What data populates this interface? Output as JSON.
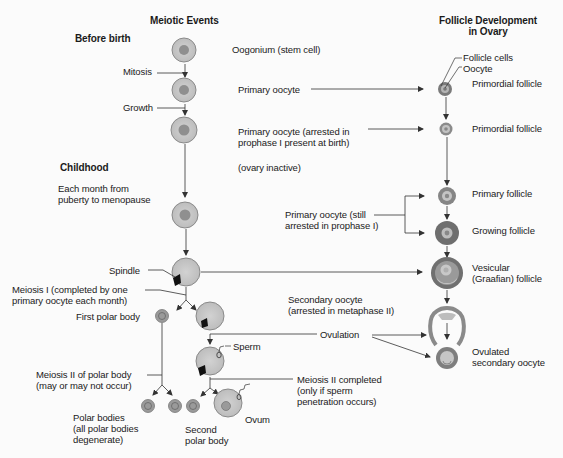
{
  "headers": {
    "meiotic_events": "Meiotic Events",
    "follicle_development_line1": "Follicle Development",
    "follicle_development_line2": "in Ovary"
  },
  "stages": {
    "before_birth": "Before birth",
    "childhood": "Childhood",
    "each_month_line1": "Each month from",
    "each_month_line2": "puberty to menopause"
  },
  "processes": {
    "mitosis": "Mitosis",
    "growth": "Growth",
    "spindle": "Spindle",
    "meiosis1_line1": "Meiosis I (completed by one",
    "meiosis1_line2": "primary oocyte each month)",
    "meiosis2_polar_line1": "Meiosis II of polar body",
    "meiosis2_polar_line2": "(may or may not occur)",
    "ovulation": "Ovulation",
    "sperm": "Sperm",
    "meiosis2_completed_line1": "Meiosis II completed",
    "meiosis2_completed_line2": "(only if sperm",
    "meiosis2_completed_line3": "penetration occurs)"
  },
  "cells": {
    "oogonium": "Oogonium (stem cell)",
    "primary_oocyte": "Primary oocyte",
    "primary_oocyte_arrested_line1": "Primary oocyte (arrested in",
    "primary_oocyte_arrested_line2": "prophase I present at birth)",
    "ovary_inactive": "(ovary inactive)",
    "primary_oocyte_still_line1": "Primary oocyte (still",
    "primary_oocyte_still_line2": "arrested in prophase I)",
    "secondary_oocyte_line1": "Secondary oocyte",
    "secondary_oocyte_line2": "(arrested in metaphase II)",
    "first_polar_body": "First polar body",
    "polar_bodies_line1": "Polar bodies",
    "polar_bodies_line2": "(all polar bodies",
    "polar_bodies_line3": "degenerate)",
    "second_polar_body_line1": "Second",
    "second_polar_body_line2": "polar body",
    "ovum": "Ovum"
  },
  "follicles": {
    "follicle_cells": "Follicle cells",
    "oocyte": "Oocyte",
    "primordial_follicle_1": "Primordial follicle",
    "primordial_follicle_2": "Primordial follicle",
    "primary_follicle": "Primary follicle",
    "growing_follicle": "Growing follicle",
    "vesicular_line1": "Vesicular",
    "vesicular_line2": "(Graafian) follicle",
    "ovulated_line1": "Ovulated",
    "ovulated_line2": "secondary oocyte"
  },
  "colors": {
    "cell_fill": "#c9c9c9",
    "cell_stroke": "#8a8a8a",
    "nucleus": "#8f8f8f",
    "follicle_dark": "#6e6e6e",
    "line": "#333333",
    "background": "#fbfbfb"
  }
}
